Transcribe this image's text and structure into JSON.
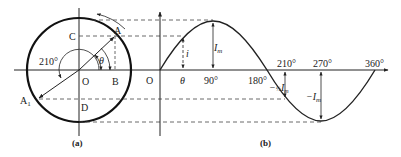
{
  "figure_a": {
    "caption": "(a)",
    "labels": {
      "origin": "O",
      "point_a": "A",
      "point_a1": "A",
      "point_a1_sub": "1",
      "point_b": "B",
      "point_c": "C",
      "point_d": "D",
      "theta": "θ",
      "angle_210": "210°"
    }
  },
  "figure_b": {
    "caption": "(b)",
    "labels": {
      "origin": "O",
      "theta": "θ",
      "deg_90": "90°",
      "deg_180": "180°",
      "deg_210": "210°",
      "deg_270": "270°",
      "deg_360": "360°",
      "i": "i",
      "im": "I",
      "im_sub": "m",
      "neg_half_im_prefix": "−",
      "half": "½",
      "neg_half_im": "I",
      "neg_half_im_sub": "m",
      "neg_im": "−I",
      "neg_im_sub": "m"
    }
  },
  "colors": {
    "stroke": "#222222",
    "dash": "#444444"
  }
}
